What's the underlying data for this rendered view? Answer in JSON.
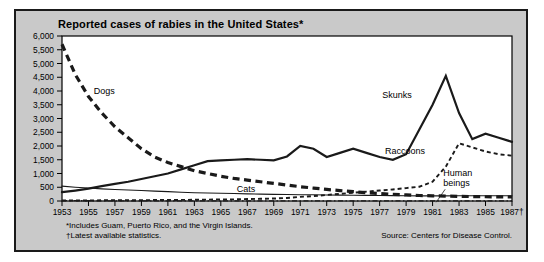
{
  "chart": {
    "title": "Reported cases of rabies in the United States*",
    "footnotes": [
      "*Includes Guam, Puerto Rico, and the Virgin Islands.",
      "†Latest available statistics."
    ],
    "source": "Source: Centers for Disease Control."
  },
  "chart_data": {
    "type": "line",
    "title": "Reported cases of rabies in the United States*",
    "xlabel": "",
    "ylabel": "",
    "ylim": [
      0,
      6000
    ],
    "ytick_step": 500,
    "yticks": [
      "0",
      "500",
      "1,000",
      "1,500",
      "2,000",
      "2,500",
      "3,000",
      "3,500",
      "4,000",
      "4,500",
      "5,000",
      "5,500",
      "6,000"
    ],
    "xlim": [
      1953,
      1987
    ],
    "xticks": [
      "1953",
      "1955",
      "1957",
      "1959",
      "1961",
      "1963",
      "1965",
      "1967",
      "1969",
      "1971",
      "1973",
      "1975",
      "1977",
      "1979",
      "1981",
      "1983",
      "1985",
      "1987†"
    ],
    "x": [
      1953,
      1954,
      1955,
      1956,
      1957,
      1958,
      1959,
      1960,
      1961,
      1962,
      1963,
      1964,
      1965,
      1966,
      1967,
      1968,
      1969,
      1970,
      1971,
      1972,
      1973,
      1974,
      1975,
      1976,
      1977,
      1978,
      1979,
      1980,
      1981,
      1982,
      1983,
      1984,
      1985,
      1986,
      1987
    ],
    "grid": false,
    "legend_position": "inline-annotations",
    "series": [
      {
        "name": "Dogs",
        "style": "thick-dashed",
        "label_x": 1955.4,
        "label_y": 3900,
        "values": [
          5700,
          4600,
          3800,
          3200,
          2700,
          2300,
          1900,
          1600,
          1400,
          1250,
          1100,
          1000,
          900,
          820,
          760,
          700,
          640,
          580,
          520,
          470,
          420,
          380,
          340,
          300,
          270,
          240,
          220,
          200,
          190,
          180,
          170,
          160,
          155,
          150,
          145
        ]
      },
      {
        "name": "Skunks",
        "style": "thick-solid",
        "label_x": 1977.2,
        "label_y": 3750,
        "values": [
          320,
          380,
          450,
          540,
          620,
          700,
          800,
          900,
          1000,
          1150,
          1300,
          1450,
          1480,
          1500,
          1520,
          1500,
          1480,
          1620,
          2000,
          1900,
          1600,
          1750,
          1900,
          1750,
          1600,
          1500,
          1700,
          2600,
          3500,
          4550,
          3200,
          2250,
          2450,
          2300,
          2150
        ]
      },
      {
        "name": "Raccoons",
        "style": "thin-dashed",
        "label_x": 1977.4,
        "label_y": 1700,
        "values": [
          20,
          20,
          20,
          25,
          25,
          30,
          30,
          35,
          35,
          40,
          45,
          50,
          55,
          60,
          70,
          80,
          90,
          110,
          150,
          180,
          220,
          260,
          300,
          340,
          380,
          420,
          470,
          520,
          700,
          1250,
          2100,
          1950,
          1800,
          1700,
          1650
        ]
      },
      {
        "name": "Cats",
        "style": "thin-solid",
        "label_x": 1966.2,
        "label_y": 330,
        "values": [
          540,
          500,
          470,
          440,
          420,
          400,
          380,
          360,
          340,
          320,
          300,
          290,
          280,
          270,
          260,
          250,
          240,
          235,
          230,
          225,
          220,
          215,
          210,
          205,
          200,
          195,
          190,
          185,
          185,
          185,
          190,
          190,
          190,
          190,
          190
        ]
      },
      {
        "name": "Human beings",
        "style": "dash-dot",
        "label_x": 1981.8,
        "label_y": 900,
        "values": [
          12,
          10,
          9,
          8,
          8,
          7,
          6,
          6,
          5,
          5,
          4,
          4,
          3,
          3,
          3,
          2,
          2,
          2,
          2,
          2,
          1,
          1,
          1,
          1,
          1,
          1,
          1,
          1,
          1,
          1,
          1,
          1,
          1,
          1,
          1
        ]
      }
    ]
  }
}
